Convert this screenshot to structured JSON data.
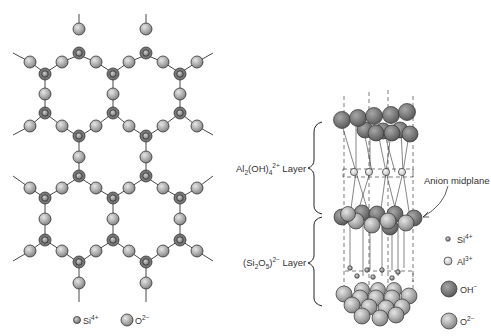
{
  "left_figure": {
    "title": "Silicate sheet (Si2O5)2- hexagonal network",
    "legend": [
      {
        "symbol": "si-ion",
        "label_base": "Si",
        "label_charge": "4+"
      },
      {
        "symbol": "o-ion",
        "label_base": "O",
        "label_charge": "2−"
      }
    ]
  },
  "right_figure": {
    "labels": {
      "al_layer": {
        "prefix": "Al",
        "sub1": "2",
        "mid": "(OH)",
        "sub2": "4",
        "sup": "2+",
        "suffix": " Layer"
      },
      "si_layer": {
        "prefix": "(Si",
        "sub1": "2",
        "mid": "O",
        "sub2": "5",
        "close": ")",
        "sup": "2−",
        "suffix": " Layer"
      },
      "anion_midplane": "Anion midplane"
    },
    "legend": [
      {
        "symbol": "si-ion",
        "label_base": "Si",
        "label_charge": "4+"
      },
      {
        "symbol": "al-ion",
        "label_base": "Al",
        "label_charge": "3+"
      },
      {
        "symbol": "oh-ion",
        "label_base": "OH",
        "label_charge": "−"
      },
      {
        "symbol": "o-ion",
        "label_base": "O",
        "label_charge": "2−"
      }
    ]
  },
  "colors": {
    "oxygen": "#a8a8a8",
    "hydroxyl": "#7a7a7a",
    "aluminum": "#d8d8d8",
    "silicon": "#888888",
    "line": "#333333"
  }
}
